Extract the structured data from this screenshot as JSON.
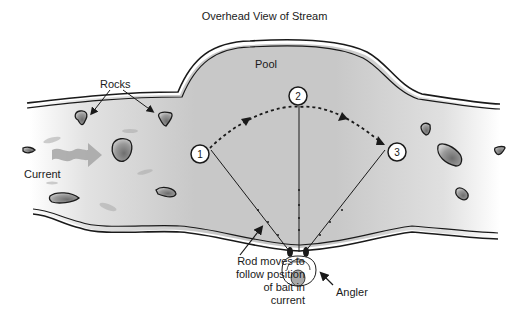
{
  "title": "Overhead View of Stream",
  "labels": {
    "pool": "Pool",
    "rocks": "Rocks",
    "current": "Current",
    "rod_note": "Rod moves to follow position of bait in current",
    "angler": "Angler"
  },
  "markers": [
    {
      "id": "1",
      "label": "1"
    },
    {
      "id": "2",
      "label": "2"
    },
    {
      "id": "3",
      "label": "3"
    }
  ],
  "colors": {
    "water": "#c4c4c4",
    "water_light": "#e6e6e6",
    "bank_line": "#1a1a1a",
    "rock_fill": "#9a9a9a",
    "current_arrow": "#a8a8a8"
  }
}
